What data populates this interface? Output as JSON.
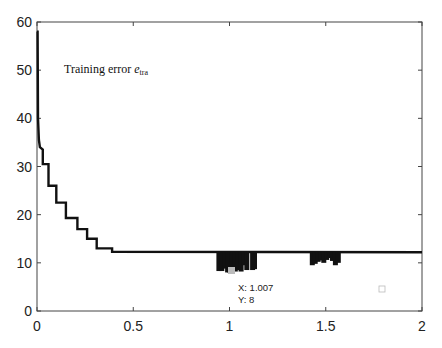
{
  "chart_data": {
    "type": "line",
    "title": "",
    "xlabel": "",
    "ylabel": "",
    "xlim": [
      0,
      2
    ],
    "ylim": [
      0,
      60
    ],
    "grid": false,
    "x_ticks": [
      "0",
      "0.5",
      "1",
      "1.5",
      "2"
    ],
    "y_ticks": [
      "0",
      "10",
      "20",
      "30",
      "40",
      "50",
      "60"
    ],
    "annotation": {
      "text": "Training error",
      "symbol": "e",
      "subscript": "tra"
    },
    "datatip": {
      "x_label": "X: 1.007",
      "y_label": "Y: 8",
      "x": 1.007,
      "y": 8
    },
    "series": [
      {
        "name": "Training error e_tra",
        "x": [
          0,
          0.005,
          0.01,
          0.02,
          0.03,
          0.05,
          0.08,
          0.12,
          0.16,
          0.2,
          0.26,
          0.31,
          0.37,
          0.45,
          0.5,
          0.95,
          1.0,
          1.007,
          1.15,
          1.45,
          1.5,
          1.57,
          2.0
        ],
        "y": [
          58,
          40,
          35,
          33.5,
          30.5,
          26,
          22.5,
          19.5,
          17,
          15,
          13,
          12.8,
          12.3,
          12.2,
          12.2,
          12.2,
          8.5,
          8,
          12.2,
          10,
          11,
          12.2,
          12.2
        ]
      }
    ]
  }
}
